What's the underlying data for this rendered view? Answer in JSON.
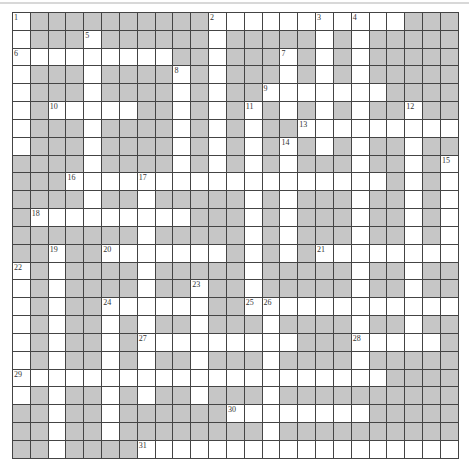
{
  "puzzle": {
    "rows": 25,
    "cols": 25,
    "colors": {
      "block": "#c6c6c6",
      "open": "#ffffff",
      "line": "#444444"
    },
    "layout": [
      ".##########...........###",
      ".###.######.#####.#.#####",
      ".........##.###.#.#.#####",
      ".###.####.#.###.#.#.#####",
      ".###.####.#.##.......####",
      ".#.....##.#.#.#.#.#.##.##",
      ".###.####.#.#.##.........",
      ".###.####.#.#.#.#.#.##.##",
      "####.####.#.#.#.###.##.#.",
      "###..................#.#.",
      "####.##.#####.#.###.##.#.",
      "#.........###.#.###.##.#.",
      "#######.#####.#.###.##.#.",
      "##.##.......#.#.#........",
      ".#.####.#####.#####.##.##",
      ".#.####.##.##.#####.##.##",
      ".#.##......##............",
      ".#.##.#.##.###.####.##.##",
      ".#.##.#.........###.....#",
      ".#.##.#.##.###.####.#####",
      ".....................####",
      ".#.##.#.##.###.##########",
      "##.##.######........#####",
      "##.##.########.##########",
      "##.####.................."
    ],
    "numbers": [
      {
        "n": "1",
        "r": 0,
        "c": 0
      },
      {
        "n": "2",
        "r": 0,
        "c": 11
      },
      {
        "n": "3",
        "r": 0,
        "c": 17
      },
      {
        "n": "4",
        "r": 0,
        "c": 19
      },
      {
        "n": "5",
        "r": 1,
        "c": 4
      },
      {
        "n": "6",
        "r": 2,
        "c": 0
      },
      {
        "n": "7",
        "r": 2,
        "c": 15
      },
      {
        "n": "8",
        "r": 3,
        "c": 9
      },
      {
        "n": "9",
        "r": 4,
        "c": 14
      },
      {
        "n": "10",
        "r": 5,
        "c": 2
      },
      {
        "n": "11",
        "r": 5,
        "c": 13
      },
      {
        "n": "12",
        "r": 5,
        "c": 22
      },
      {
        "n": "13",
        "r": 6,
        "c": 16
      },
      {
        "n": "14",
        "r": 7,
        "c": 15
      },
      {
        "n": "15",
        "r": 8,
        "c": 24
      },
      {
        "n": "16",
        "r": 9,
        "c": 3
      },
      {
        "n": "17",
        "r": 9,
        "c": 7
      },
      {
        "n": "18",
        "r": 11,
        "c": 1
      },
      {
        "n": "19",
        "r": 13,
        "c": 2
      },
      {
        "n": "20",
        "r": 13,
        "c": 5
      },
      {
        "n": "21",
        "r": 13,
        "c": 17
      },
      {
        "n": "22",
        "r": 14,
        "c": 0
      },
      {
        "n": "23",
        "r": 15,
        "c": 10
      },
      {
        "n": "24",
        "r": 16,
        "c": 5
      },
      {
        "n": "25",
        "r": 16,
        "c": 13
      },
      {
        "n": "26",
        "r": 16,
        "c": 14
      },
      {
        "n": "27",
        "r": 18,
        "c": 7
      },
      {
        "n": "28",
        "r": 18,
        "c": 19
      },
      {
        "n": "29",
        "r": 20,
        "c": 0
      },
      {
        "n": "30",
        "r": 22,
        "c": 12
      },
      {
        "n": "31",
        "r": 24,
        "c": 7
      }
    ]
  }
}
